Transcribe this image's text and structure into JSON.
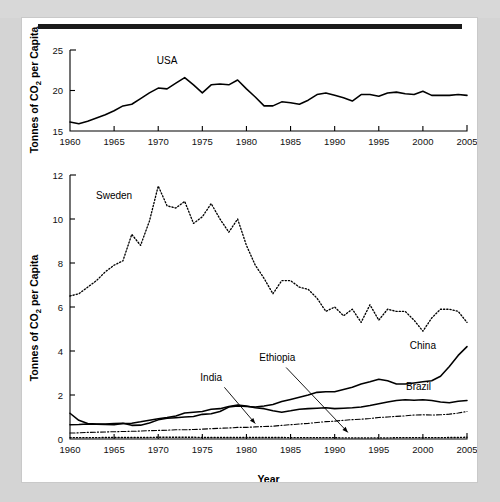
{
  "figure": {
    "xlabel": "Year",
    "ylabel": "Tonnes of CO2 per Capita",
    "ylabel_prefix": "Tonnes of CO",
    "ylabel_sub": "2",
    "ylabel_suffix": " per Capita"
  },
  "chart_data": [
    {
      "id": "usa-panel",
      "type": "line",
      "title": "",
      "xlabel": "",
      "ylabel": "Tonnes of CO2 per Capita",
      "xlim": [
        1960,
        2005
      ],
      "ylim": [
        15,
        25
      ],
      "xticks": [
        1960,
        1965,
        1970,
        1975,
        1980,
        1985,
        1990,
        1995,
        2000,
        2005
      ],
      "yticks": [
        15,
        20,
        25
      ],
      "grid": false,
      "legend": "inline-labels",
      "series": [
        {
          "name": "USA",
          "style": "solid",
          "label_x": 1971.0,
          "label_y": 23.3,
          "x": [
            1960,
            1961,
            1962,
            1963,
            1964,
            1965,
            1966,
            1967,
            1968,
            1969,
            1970,
            1971,
            1972,
            1973,
            1974,
            1975,
            1976,
            1977,
            1978,
            1979,
            1980,
            1981,
            1982,
            1983,
            1984,
            1985,
            1986,
            1987,
            1988,
            1989,
            1990,
            1991,
            1992,
            1993,
            1994,
            1995,
            1996,
            1997,
            1998,
            1999,
            2000,
            2001,
            2002,
            2003,
            2004,
            2005
          ],
          "y": [
            16.1,
            15.9,
            16.2,
            16.6,
            17.0,
            17.5,
            18.1,
            18.3,
            19.0,
            19.7,
            20.3,
            20.2,
            20.9,
            21.6,
            20.7,
            19.7,
            20.7,
            20.8,
            20.7,
            21.3,
            20.2,
            19.2,
            18.1,
            18.1,
            18.6,
            18.5,
            18.3,
            18.8,
            19.5,
            19.7,
            19.4,
            19.1,
            18.7,
            19.5,
            19.5,
            19.3,
            19.7,
            19.8,
            19.6,
            19.5,
            19.9,
            19.4,
            19.4,
            19.4,
            19.5,
            19.4
          ]
        }
      ]
    },
    {
      "id": "countries-panel",
      "type": "line",
      "title": "",
      "xlabel": "Year",
      "ylabel": "Tonnes of CO2 per Capita",
      "xlim": [
        1960,
        2005
      ],
      "ylim": [
        0,
        12
      ],
      "xticks": [
        1960,
        1965,
        1970,
        1975,
        1980,
        1985,
        1990,
        1995,
        2000,
        2005
      ],
      "yticks": [
        0,
        2,
        4,
        6,
        8,
        10,
        12
      ],
      "grid": false,
      "legend": "inline-labels",
      "series": [
        {
          "name": "Sweden",
          "style": "dotted",
          "label_x": 1965.0,
          "label_y": 10.9,
          "x": [
            1960,
            1961,
            1962,
            1963,
            1964,
            1965,
            1966,
            1967,
            1968,
            1969,
            1970,
            1971,
            1972,
            1973,
            1974,
            1975,
            1976,
            1977,
            1978,
            1979,
            1980,
            1981,
            1982,
            1983,
            1984,
            1985,
            1986,
            1987,
            1988,
            1989,
            1990,
            1991,
            1992,
            1993,
            1994,
            1995,
            1996,
            1997,
            1998,
            1999,
            2000,
            2001,
            2002,
            2003,
            2004,
            2005
          ],
          "y": [
            6.5,
            6.6,
            6.9,
            7.2,
            7.6,
            7.9,
            8.1,
            9.3,
            8.8,
            9.9,
            11.5,
            10.6,
            10.5,
            10.8,
            9.8,
            10.1,
            10.7,
            10.0,
            9.4,
            10.0,
            8.8,
            7.9,
            7.3,
            6.6,
            7.2,
            7.2,
            6.9,
            6.8,
            6.4,
            5.8,
            6.0,
            5.6,
            5.9,
            5.3,
            6.1,
            5.4,
            5.9,
            5.8,
            5.8,
            5.4,
            4.9,
            5.5,
            5.9,
            5.9,
            5.8,
            5.3
          ]
        },
        {
          "name": "China",
          "style": "solid",
          "label_x": 2000.0,
          "label_y": 4.1,
          "x": [
            1960,
            1961,
            1962,
            1963,
            1964,
            1965,
            1966,
            1967,
            1968,
            1969,
            1970,
            1971,
            1972,
            1973,
            1974,
            1975,
            1976,
            1977,
            1978,
            1979,
            1980,
            1981,
            1982,
            1983,
            1984,
            1985,
            1986,
            1987,
            1988,
            1989,
            1990,
            1991,
            1992,
            1993,
            1994,
            1995,
            1996,
            1997,
            1998,
            1999,
            2000,
            2001,
            2002,
            2003,
            2004,
            2005
          ],
          "y": [
            1.17,
            0.85,
            0.7,
            0.68,
            0.68,
            0.7,
            0.72,
            0.62,
            0.63,
            0.73,
            0.87,
            0.94,
            0.97,
            1.0,
            1.02,
            1.12,
            1.15,
            1.25,
            1.45,
            1.5,
            1.48,
            1.45,
            1.5,
            1.57,
            1.7,
            1.8,
            1.9,
            2.0,
            2.12,
            2.15,
            2.15,
            2.25,
            2.35,
            2.5,
            2.6,
            2.72,
            2.65,
            2.5,
            2.5,
            2.55,
            2.6,
            2.65,
            2.85,
            3.3,
            3.8,
            4.2
          ]
        },
        {
          "name": "Brazil",
          "style": "solid",
          "label_x": 1999.5,
          "label_y": 2.25,
          "x": [
            1960,
            1961,
            1962,
            1963,
            1964,
            1965,
            1966,
            1967,
            1968,
            1969,
            1970,
            1971,
            1972,
            1973,
            1974,
            1975,
            1976,
            1977,
            1978,
            1979,
            1980,
            1981,
            1982,
            1983,
            1984,
            1985,
            1986,
            1987,
            1988,
            1989,
            1990,
            1991,
            1992,
            1993,
            1994,
            1995,
            1996,
            1997,
            1998,
            1999,
            2000,
            2001,
            2002,
            2003,
            2004,
            2005
          ],
          "y": [
            0.65,
            0.66,
            0.68,
            0.67,
            0.66,
            0.65,
            0.7,
            0.72,
            0.78,
            0.85,
            0.92,
            0.98,
            1.05,
            1.18,
            1.22,
            1.25,
            1.35,
            1.38,
            1.48,
            1.55,
            1.5,
            1.42,
            1.38,
            1.28,
            1.22,
            1.28,
            1.35,
            1.38,
            1.4,
            1.42,
            1.38,
            1.4,
            1.42,
            1.45,
            1.52,
            1.6,
            1.68,
            1.75,
            1.78,
            1.76,
            1.78,
            1.75,
            1.68,
            1.65,
            1.72,
            1.75
          ]
        },
        {
          "name": "India",
          "style": "dashdot",
          "label_x": 1976.0,
          "label_y": 2.65,
          "arrow": {
            "x1": 1977.5,
            "y1": 2.35,
            "x2": 1981.0,
            "y2": 0.7
          },
          "x": [
            1960,
            1961,
            1962,
            1963,
            1964,
            1965,
            1966,
            1967,
            1968,
            1969,
            1970,
            1971,
            1972,
            1973,
            1974,
            1975,
            1976,
            1977,
            1978,
            1979,
            1980,
            1981,
            1982,
            1983,
            1984,
            1985,
            1986,
            1987,
            1988,
            1989,
            1990,
            1991,
            1992,
            1993,
            1994,
            1995,
            1996,
            1997,
            1998,
            1999,
            2000,
            2001,
            2002,
            2003,
            2004,
            2005
          ],
          "y": [
            0.27,
            0.28,
            0.3,
            0.31,
            0.32,
            0.33,
            0.34,
            0.35,
            0.36,
            0.38,
            0.39,
            0.4,
            0.42,
            0.42,
            0.43,
            0.45,
            0.47,
            0.49,
            0.5,
            0.53,
            0.53,
            0.55,
            0.57,
            0.58,
            0.62,
            0.65,
            0.68,
            0.71,
            0.75,
            0.79,
            0.81,
            0.85,
            0.88,
            0.9,
            0.93,
            0.98,
            1.0,
            1.03,
            1.05,
            1.09,
            1.1,
            1.09,
            1.1,
            1.13,
            1.18,
            1.25
          ]
        },
        {
          "name": "Ethiopia",
          "style": "dotted",
          "label_x": 1983.5,
          "label_y": 3.55,
          "arrow": {
            "x1": 1984.5,
            "y1": 3.25,
            "x2": 1991.5,
            "y2": 0.3
          },
          "x": [
            1960,
            1961,
            1962,
            1963,
            1964,
            1965,
            1966,
            1967,
            1968,
            1969,
            1970,
            1971,
            1972,
            1973,
            1974,
            1975,
            1976,
            1977,
            1978,
            1979,
            1980,
            1981,
            1982,
            1983,
            1984,
            1985,
            1986,
            1987,
            1988,
            1989,
            1990,
            1991,
            1992,
            1993,
            1994,
            1995,
            1996,
            1997,
            1998,
            1999,
            2000,
            2001,
            2002,
            2003,
            2004,
            2005
          ],
          "y": [
            0.06,
            0.06,
            0.06,
            0.06,
            0.07,
            0.07,
            0.07,
            0.07,
            0.07,
            0.07,
            0.08,
            0.08,
            0.08,
            0.08,
            0.08,
            0.07,
            0.07,
            0.07,
            0.07,
            0.07,
            0.07,
            0.07,
            0.07,
            0.07,
            0.07,
            0.06,
            0.06,
            0.06,
            0.06,
            0.06,
            0.06,
            0.05,
            0.05,
            0.05,
            0.05,
            0.05,
            0.05,
            0.06,
            0.06,
            0.06,
            0.06,
            0.06,
            0.06,
            0.07,
            0.07,
            0.08
          ]
        }
      ]
    }
  ]
}
